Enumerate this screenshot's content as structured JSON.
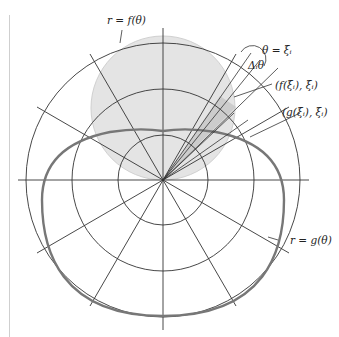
{
  "diagram": {
    "type": "polar region area diagram",
    "labels": {
      "f_curve": "r = f(θ)",
      "theta_ray": "θ = ξᵢ",
      "delta_theta": "Δᵢθ",
      "f_point": "(f(ξᵢ), ξᵢ)",
      "g_point": "(g(ξᵢ), ξᵢ)",
      "g_curve": "r = g(θ)"
    },
    "grid": {
      "center": [
        163,
        180
      ],
      "circle_radii": [
        45,
        91,
        137
      ],
      "ray_count": 12
    },
    "colors": {
      "line": "#3a3a3a",
      "shade_region": "#e2e2e2",
      "sector_shade": "#c8c8c8",
      "g_curve": "#7a7a7a"
    }
  }
}
